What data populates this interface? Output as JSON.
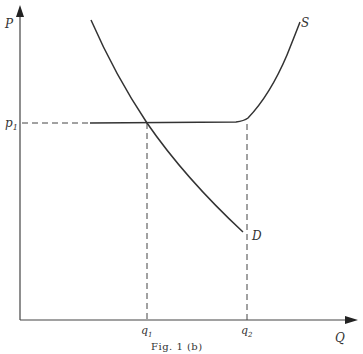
{
  "figure": {
    "caption": "Fig. 1 (b)",
    "axes": {
      "y_label": "P",
      "x_label": "Q"
    },
    "price_label": "p",
    "price_subscript": "1",
    "quantity_labels": [
      {
        "base": "q",
        "sub": "1"
      },
      {
        "base": "q",
        "sub": "2"
      }
    ],
    "curves": {
      "supply_label": "S",
      "demand_label": "D"
    },
    "colors": {
      "line": "#333333",
      "background": "#ffffff"
    }
  }
}
